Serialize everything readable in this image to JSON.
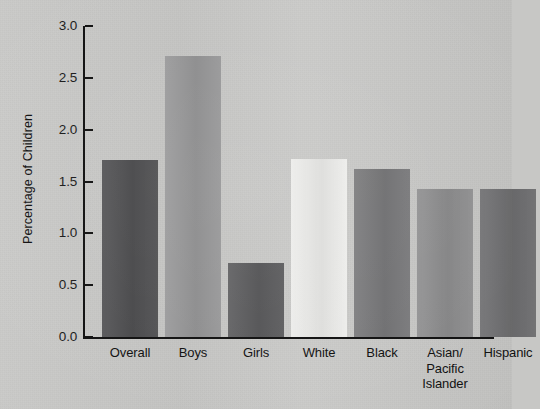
{
  "chart_data": {
    "type": "bar",
    "title": "",
    "subtitle": "",
    "xlabel": "",
    "ylabel": "Percentage of Children",
    "categories": [
      "Overall",
      "Boys",
      "Girls",
      "White",
      "Black",
      "Asian/\nPacific\nIslander",
      "Hispanic"
    ],
    "category_lines": [
      [
        "Overall"
      ],
      [
        "Boys"
      ],
      [
        "Girls"
      ],
      [
        "White"
      ],
      [
        "Black"
      ],
      [
        "Asian/",
        "Pacific",
        "Islander"
      ],
      [
        "Hispanic"
      ]
    ],
    "values": [
      1.71,
      2.71,
      0.71,
      1.72,
      1.62,
      1.43,
      1.43
    ],
    "bar_colors": [
      "#4e4e50",
      "#969697",
      "#5a5a5c",
      "#ececea",
      "#777779",
      "#8d8d8e",
      "#6e6e70"
    ],
    "ylim": [
      0.0,
      3.0
    ],
    "ytick_labels": [
      "3.0",
      "2.5",
      "2.0",
      "1.5",
      "1.0",
      "0.5",
      "0.0"
    ],
    "ytick_values": [
      3.0,
      2.5,
      2.0,
      1.5,
      1.0,
      0.5,
      0.0
    ],
    "grid": false,
    "legend": false,
    "legend_position": "none",
    "background_color": "#c7c7c5",
    "axis_color": "#111111",
    "text_color": "#111111"
  }
}
